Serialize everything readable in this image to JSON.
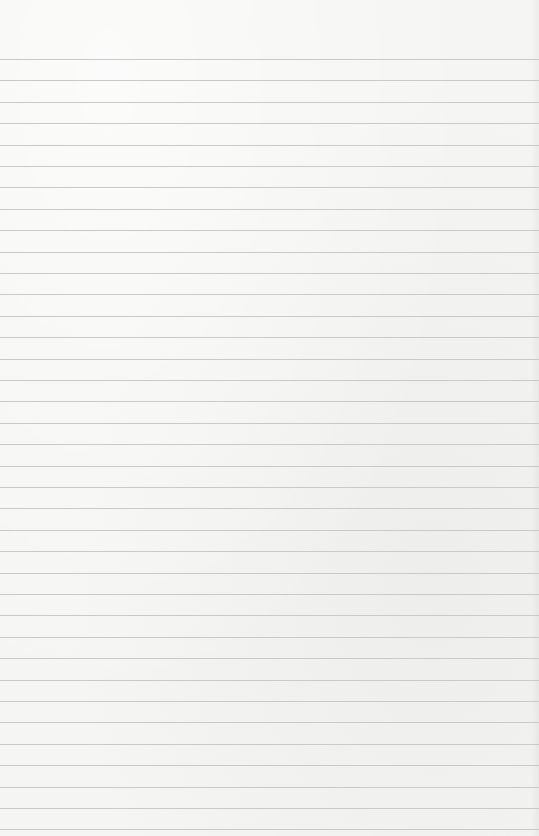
{
  "paper": {
    "type": "lined-paper",
    "background_color": "#f5f5f3",
    "rule_color": "#c9c9c6",
    "first_rule_y": 59,
    "rule_spacing": 21.4,
    "rule_count": 37
  }
}
